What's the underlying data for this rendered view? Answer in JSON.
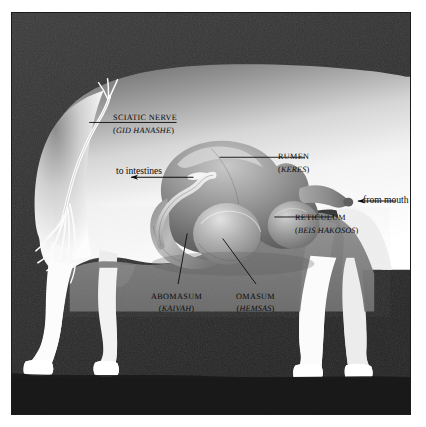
{
  "figure": {
    "style": "halftone grayscale engraving plate",
    "frame_color": "#1c1c1c",
    "background_color": "#2e2e2e",
    "ink_color": "#0b0b0b",
    "body_color": "#ffffff"
  },
  "labels": {
    "sciatic": {
      "term": "SCIATIC NERVE",
      "hebrew": "GID HANASHE",
      "open_paren": "(",
      "close_paren": ")"
    },
    "rumen": {
      "term": "RUMEN",
      "hebrew": "KERES",
      "open_paren": "(",
      "close_paren": ")"
    },
    "reticulum": {
      "term": "RETICULUM",
      "hebrew": "BEIS HAKOSOS",
      "open_paren": "(",
      "close_paren": ")"
    },
    "abomasum": {
      "term": "ABOMASUM",
      "hebrew": "KAIVAH",
      "open_paren": "(",
      "close_paren": ")"
    },
    "omasum": {
      "term": "OMASUM",
      "hebrew": "HEMSAS",
      "open_paren": "(",
      "close_paren": ")"
    }
  },
  "flow": {
    "to_intestines": "to intestines",
    "from_mouth": "from mouth"
  },
  "anatomy_parts": [
    "rumen",
    "reticulum",
    "omasum",
    "abomasum",
    "esophagus",
    "sciatic-nerve"
  ]
}
